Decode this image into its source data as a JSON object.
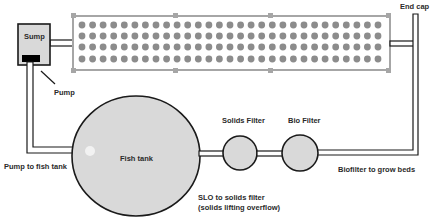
{
  "diagram": {
    "type": "aquaponics-system-flow",
    "colors": {
      "outline": "#1a1a1a",
      "fill": "#d9d9d9",
      "grow_bed_border": "#a6a6a6",
      "plant": "#8c8c8c",
      "pump": "#000000"
    },
    "components": {
      "sump": {
        "label": "Sump"
      },
      "pump": {
        "label": "Pump"
      },
      "grow_bed": {
        "rows": 4,
        "columns": 29
      },
      "end_cap": {
        "label": "End cap"
      },
      "fish_tank": {
        "label": "Fish tank"
      },
      "solids_filter": {
        "label": "Solids Filter"
      },
      "bio_filter": {
        "label": "Bio Filter"
      }
    },
    "flows": {
      "pump_to_fish_tank": {
        "label": "Pump to fish tank"
      },
      "slo_to_solids_filter": {
        "line1": "SLO to solids filter",
        "line2": "(solids lifting overflow)"
      },
      "biofilter_to_grow_beds": {
        "label": "Biofilter to grow beds"
      }
    }
  }
}
